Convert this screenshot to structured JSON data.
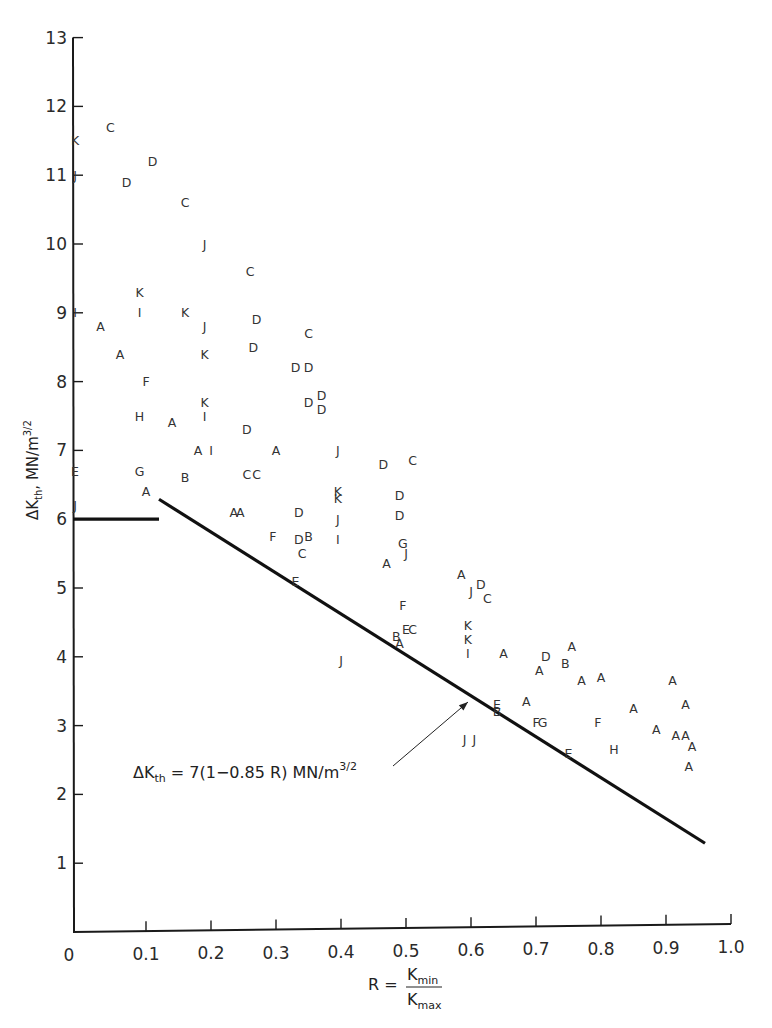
{
  "chart_data": {
    "type": "scatter",
    "title": "",
    "xlabel": "R = Kmin / Kmax",
    "xlabel_parts": {
      "lhs": "R =",
      "num_main": "K",
      "num_sub": "min",
      "den_main": "K",
      "den_sub": "max"
    },
    "ylabel": "ΔKth, MN/m^3/2",
    "ylabel_parts": {
      "delta": "ΔK",
      "sub": "th",
      "rest": ", MN/m",
      "sup": "3/2"
    },
    "xlim": [
      0,
      1.0
    ],
    "ylim": [
      0,
      13
    ],
    "grid": false,
    "x_ticks": [
      0,
      0.1,
      0.2,
      0.3,
      0.4,
      0.5,
      0.6,
      0.7,
      0.8,
      0.9,
      1.0
    ],
    "x_tick_labels": [
      "0",
      "0.1",
      "0.2",
      "0.3",
      "0.4",
      "0.5",
      "0.6",
      "0.7",
      "0.8",
      "0.9",
      "1.0"
    ],
    "y_ticks": [
      1,
      2,
      3,
      4,
      5,
      6,
      7,
      8,
      9,
      10,
      11,
      12,
      13
    ],
    "y_tick_labels": [
      "1",
      "2",
      "3",
      "4",
      "5",
      "6",
      "7",
      "8",
      "9",
      "10",
      "11",
      "12",
      "13"
    ],
    "annotation": {
      "text_prefix": "ΔK",
      "text_sub": "th",
      "text_body": " = 7(1−0.85 R) MN/m",
      "text_sup": "3/2",
      "arrow_to": [
        0.6,
        3.43
      ]
    },
    "fit_lines": [
      {
        "name": "threshold-plateau",
        "x": [
          0,
          0.12
        ],
        "y": [
          6.0,
          6.0
        ]
      },
      {
        "name": "dKth = 7(1-0.85R)",
        "x": [
          0.12,
          0.96
        ],
        "y": [
          6.29,
          1.29
        ]
      }
    ],
    "points": [
      {
        "label": "K",
        "x": 0.0,
        "y": 11.5
      },
      {
        "label": "C",
        "x": 0.045,
        "y": 11.7
      },
      {
        "label": "J",
        "x": 0.0,
        "y": 11.0
      },
      {
        "label": "D",
        "x": 0.07,
        "y": 10.9
      },
      {
        "label": "D",
        "x": 0.11,
        "y": 11.2
      },
      {
        "label": "C",
        "x": 0.16,
        "y": 10.6
      },
      {
        "label": "J",
        "x": 0.19,
        "y": 10.0
      },
      {
        "label": "C",
        "x": 0.26,
        "y": 9.6
      },
      {
        "label": "K",
        "x": 0.09,
        "y": 9.3
      },
      {
        "label": "I",
        "x": 0.0,
        "y": 9.0
      },
      {
        "label": "I",
        "x": 0.09,
        "y": 9.0
      },
      {
        "label": "K",
        "x": 0.16,
        "y": 9.0
      },
      {
        "label": "A",
        "x": 0.03,
        "y": 8.8
      },
      {
        "label": "J",
        "x": 0.19,
        "y": 8.8
      },
      {
        "label": "D",
        "x": 0.27,
        "y": 8.9
      },
      {
        "label": "C",
        "x": 0.35,
        "y": 8.7
      },
      {
        "label": "A",
        "x": 0.06,
        "y": 8.4
      },
      {
        "label": "K",
        "x": 0.19,
        "y": 8.4
      },
      {
        "label": "D",
        "x": 0.265,
        "y": 8.5
      },
      {
        "label": "D",
        "x": 0.33,
        "y": 8.2
      },
      {
        "label": "D",
        "x": 0.35,
        "y": 8.2
      },
      {
        "label": "F",
        "x": 0.1,
        "y": 8.0
      },
      {
        "label": "K",
        "x": 0.19,
        "y": 7.7
      },
      {
        "label": "I",
        "x": 0.19,
        "y": 7.5
      },
      {
        "label": "H",
        "x": 0.09,
        "y": 7.5
      },
      {
        "label": "A",
        "x": 0.14,
        "y": 7.4
      },
      {
        "label": "D",
        "x": 0.35,
        "y": 7.7
      },
      {
        "label": "D",
        "x": 0.37,
        "y": 7.8
      },
      {
        "label": "D",
        "x": 0.37,
        "y": 7.6
      },
      {
        "label": "D",
        "x": 0.255,
        "y": 7.3
      },
      {
        "label": "A",
        "x": 0.18,
        "y": 7.0
      },
      {
        "label": "I",
        "x": 0.2,
        "y": 7.0
      },
      {
        "label": "A",
        "x": 0.3,
        "y": 7.0
      },
      {
        "label": "J",
        "x": 0.395,
        "y": 7.0
      },
      {
        "label": "E",
        "x": 0.0,
        "y": 6.7
      },
      {
        "label": "J",
        "x": 0.0,
        "y": 6.2
      },
      {
        "label": "G",
        "x": 0.09,
        "y": 6.7
      },
      {
        "label": "A",
        "x": 0.1,
        "y": 6.4
      },
      {
        "label": "B",
        "x": 0.16,
        "y": 6.6
      },
      {
        "label": "C",
        "x": 0.255,
        "y": 6.65
      },
      {
        "label": "C",
        "x": 0.27,
        "y": 6.65
      },
      {
        "label": "A",
        "x": 0.235,
        "y": 6.1
      },
      {
        "label": "A",
        "x": 0.245,
        "y": 6.1
      },
      {
        "label": "D",
        "x": 0.335,
        "y": 6.1
      },
      {
        "label": "D",
        "x": 0.465,
        "y": 6.8
      },
      {
        "label": "C",
        "x": 0.51,
        "y": 6.85
      },
      {
        "label": "K",
        "x": 0.395,
        "y": 6.4
      },
      {
        "label": "K",
        "x": 0.395,
        "y": 6.3
      },
      {
        "label": "J",
        "x": 0.395,
        "y": 6.0
      },
      {
        "label": "D",
        "x": 0.49,
        "y": 6.35
      },
      {
        "label": "D",
        "x": 0.49,
        "y": 6.05
      },
      {
        "label": "F",
        "x": 0.295,
        "y": 5.75
      },
      {
        "label": "D",
        "x": 0.335,
        "y": 5.7
      },
      {
        "label": "B",
        "x": 0.35,
        "y": 5.75
      },
      {
        "label": "C",
        "x": 0.34,
        "y": 5.5
      },
      {
        "label": "I",
        "x": 0.395,
        "y": 5.7
      },
      {
        "label": "G",
        "x": 0.495,
        "y": 5.65
      },
      {
        "label": "J",
        "x": 0.5,
        "y": 5.5
      },
      {
        "label": "A",
        "x": 0.47,
        "y": 5.35
      },
      {
        "label": "E",
        "x": 0.33,
        "y": 5.1
      },
      {
        "label": "F",
        "x": 0.495,
        "y": 4.75
      },
      {
        "label": "E",
        "x": 0.5,
        "y": 4.4
      },
      {
        "label": "C",
        "x": 0.51,
        "y": 4.4
      },
      {
        "label": "B",
        "x": 0.485,
        "y": 4.3
      },
      {
        "label": "A",
        "x": 0.49,
        "y": 4.2
      },
      {
        "label": "J",
        "x": 0.4,
        "y": 3.95
      },
      {
        "label": "A",
        "x": 0.585,
        "y": 5.2
      },
      {
        "label": "J",
        "x": 0.6,
        "y": 4.95
      },
      {
        "label": "D",
        "x": 0.615,
        "y": 5.05
      },
      {
        "label": "C",
        "x": 0.625,
        "y": 4.85
      },
      {
        "label": "K",
        "x": 0.595,
        "y": 4.45
      },
      {
        "label": "K",
        "x": 0.595,
        "y": 4.25
      },
      {
        "label": "I",
        "x": 0.595,
        "y": 4.05
      },
      {
        "label": "A",
        "x": 0.65,
        "y": 4.05
      },
      {
        "label": "D",
        "x": 0.715,
        "y": 4.0
      },
      {
        "label": "A",
        "x": 0.705,
        "y": 3.8
      },
      {
        "label": "B",
        "x": 0.745,
        "y": 3.9
      },
      {
        "label": "A",
        "x": 0.755,
        "y": 4.15
      },
      {
        "label": "A",
        "x": 0.77,
        "y": 3.65
      },
      {
        "label": "A",
        "x": 0.8,
        "y": 3.7
      },
      {
        "label": "A",
        "x": 0.685,
        "y": 3.35
      },
      {
        "label": "E",
        "x": 0.64,
        "y": 3.3
      },
      {
        "label": "B",
        "x": 0.64,
        "y": 3.2
      },
      {
        "label": "F",
        "x": 0.7,
        "y": 3.05
      },
      {
        "label": "G",
        "x": 0.71,
        "y": 3.05
      },
      {
        "label": "F",
        "x": 0.795,
        "y": 3.05
      },
      {
        "label": "J",
        "x": 0.59,
        "y": 2.8
      },
      {
        "label": "J",
        "x": 0.605,
        "y": 2.8
      },
      {
        "label": "E",
        "x": 0.75,
        "y": 2.6
      },
      {
        "label": "H",
        "x": 0.82,
        "y": 2.65
      },
      {
        "label": "A",
        "x": 0.85,
        "y": 3.25
      },
      {
        "label": "A",
        "x": 0.885,
        "y": 2.95
      },
      {
        "label": "A",
        "x": 0.91,
        "y": 3.65
      },
      {
        "label": "A",
        "x": 0.93,
        "y": 3.3
      },
      {
        "label": "A",
        "x": 0.915,
        "y": 2.85
      },
      {
        "label": "A",
        "x": 0.93,
        "y": 2.85
      },
      {
        "label": "A",
        "x": 0.94,
        "y": 2.7
      },
      {
        "label": "A",
        "x": 0.935,
        "y": 2.4
      }
    ]
  }
}
